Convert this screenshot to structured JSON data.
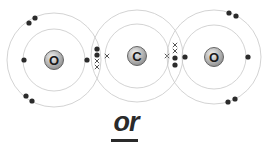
{
  "diagram": {
    "colors": {
      "shell": "#c8c8c8",
      "electron_dot": "#2b2b2b",
      "electron_cross": "#555555",
      "nucleus_fill_light": "#f2f2f2",
      "nucleus_fill_dark": "#8a8a8a",
      "nucleus_text": "#1a1a1a"
    },
    "atoms": [
      {
        "id": "oxygen-left",
        "symbol": "O",
        "shells": 2
      },
      {
        "id": "carbon",
        "symbol": "C",
        "shells": 2
      },
      {
        "id": "oxygen-right",
        "symbol": "O",
        "shells": 2
      }
    ],
    "electron_legend": {
      "dot": "oxygen electron",
      "cross": "carbon electron"
    },
    "bonds": [
      {
        "between": [
          "oxygen-left",
          "carbon"
        ],
        "shared_dots": 2,
        "shared_crosses": 2
      },
      {
        "between": [
          "carbon",
          "oxygen-right"
        ],
        "shared_dots": 2,
        "shared_crosses": 2
      }
    ]
  },
  "footer": {
    "or_label": "or"
  }
}
